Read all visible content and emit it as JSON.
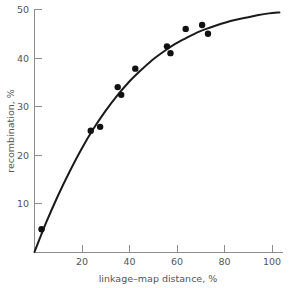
{
  "chart_data": {
    "type": "scatter",
    "title": "",
    "xlabel": "linkage–map distance, %",
    "ylabel": "recombination, %",
    "xlim": [
      0,
      106
    ],
    "ylim": [
      0,
      50
    ],
    "grid": false,
    "legend": null,
    "xticks": [
      20,
      40,
      60,
      80,
      100
    ],
    "xtick_labels": [
      "20",
      "40",
      "60",
      "80",
      "100"
    ],
    "yticks": [
      10,
      20,
      30,
      40,
      50
    ],
    "ytick_labels": [
      "10",
      "20",
      "30",
      "40",
      "50"
    ],
    "points": [
      {
        "x": 3,
        "y": 4.7
      },
      {
        "x": 24,
        "y": 25.0
      },
      {
        "x": 28,
        "y": 25.8
      },
      {
        "x": 35.5,
        "y": 34.0
      },
      {
        "x": 37,
        "y": 32.4
      },
      {
        "x": 43,
        "y": 37.8
      },
      {
        "x": 56.5,
        "y": 42.4
      },
      {
        "x": 58,
        "y": 41.0
      },
      {
        "x": 64.5,
        "y": 46.0
      },
      {
        "x": 71.5,
        "y": 46.8
      },
      {
        "x": 74,
        "y": 45.0
      }
    ],
    "curve": {
      "name": "fitted mapping function",
      "description": "saturating curve from origin approaching 50% recombination",
      "points": [
        {
          "x": 0,
          "y": 0
        },
        {
          "x": 5,
          "y": 6.1
        },
        {
          "x": 10,
          "y": 11.6
        },
        {
          "x": 15,
          "y": 16.6
        },
        {
          "x": 20,
          "y": 21.2
        },
        {
          "x": 25,
          "y": 25.3
        },
        {
          "x": 30,
          "y": 28.9
        },
        {
          "x": 35,
          "y": 32.1
        },
        {
          "x": 40,
          "y": 34.9
        },
        {
          "x": 45,
          "y": 37.3
        },
        {
          "x": 50,
          "y": 39.5
        },
        {
          "x": 55,
          "y": 41.3
        },
        {
          "x": 60,
          "y": 42.9
        },
        {
          "x": 65,
          "y": 44.2
        },
        {
          "x": 70,
          "y": 45.4
        },
        {
          "x": 75,
          "y": 46.3
        },
        {
          "x": 80,
          "y": 47.1
        },
        {
          "x": 85,
          "y": 47.8
        },
        {
          "x": 90,
          "y": 48.3
        },
        {
          "x": 95,
          "y": 48.8
        },
        {
          "x": 100,
          "y": 49.2
        },
        {
          "x": 104.5,
          "y": 49.4
        }
      ]
    }
  },
  "colors": {
    "background": "#ffffff",
    "axis": "#8c8c8c",
    "text": "#555555",
    "curve": "#1a1a1a",
    "marker": "#111111"
  }
}
